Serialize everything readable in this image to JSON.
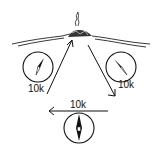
{
  "diagram": {
    "type": "navigation-triangle",
    "landmark": {
      "name": "campfire-on-hill"
    },
    "legs": [
      {
        "id": "leg-1",
        "distance_label": "10k",
        "direction": "up-right toward landmark"
      },
      {
        "id": "leg-2",
        "distance_label": "10k",
        "direction": "down-right away from landmark"
      },
      {
        "id": "leg-3",
        "distance_label": "10k",
        "direction": "left"
      }
    ],
    "compasses": [
      {
        "id": "compass-left",
        "needle": "pointing north-east"
      },
      {
        "id": "compass-right",
        "needle": "pointing north-west"
      },
      {
        "id": "compass-bottom",
        "needle": "pointing north"
      }
    ],
    "colors": {
      "ink": "#111111",
      "background": "#ffffff"
    }
  }
}
